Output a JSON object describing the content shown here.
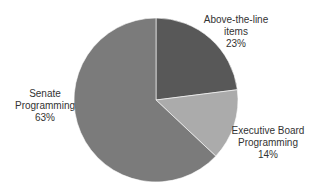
{
  "chart_data": {
    "type": "pie",
    "title": "",
    "categories": [
      "Above-the-line items",
      "Executive Board Programming",
      "Senate Programming"
    ],
    "values": [
      23,
      14,
      63
    ],
    "unit": "%",
    "start_angle_deg": 0,
    "direction": "clockwise",
    "legend": "none",
    "data_labels": "outside, category name + percent",
    "slices": [
      {
        "name": "Above-the-line items",
        "label_lines": [
          "Above-the-line",
          "items",
          "23%"
        ],
        "value": 23,
        "color": "#585858",
        "label_pos": {
          "x": 236,
          "y": 14
        }
      },
      {
        "name": "Executive Board Programming",
        "label_lines": [
          "Executive Board",
          "Programming",
          "14%"
        ],
        "value": 14,
        "color": "#ababab",
        "label_pos": {
          "x": 268,
          "y": 125
        }
      },
      {
        "name": "Senate Programming",
        "label_lines": [
          "Senate",
          "Programming",
          "63%"
        ],
        "value": 63,
        "color": "#7b7b7b",
        "label_pos": {
          "x": 45,
          "y": 88
        }
      }
    ],
    "geometry": {
      "cx": 156,
      "cy": 100,
      "r": 82
    }
  }
}
